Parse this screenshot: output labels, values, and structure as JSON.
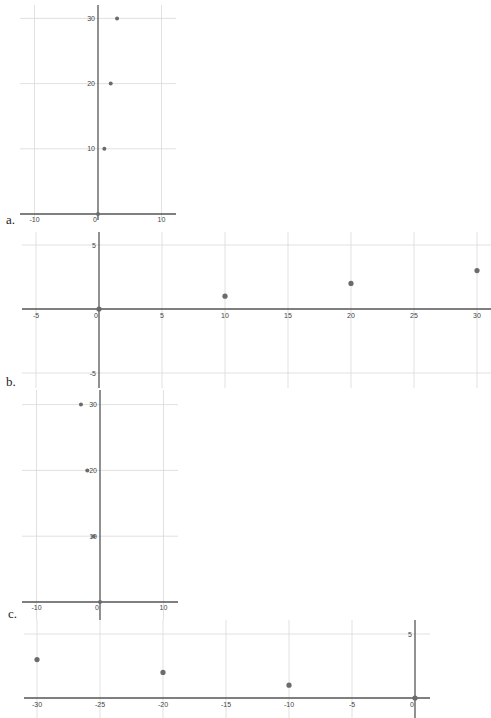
{
  "panels": {
    "a": {
      "label": "a."
    },
    "b": {
      "label": "b."
    },
    "c": {
      "label": "c."
    },
    "d": {
      "label": ""
    }
  },
  "chart_data": [
    {
      "id": "a",
      "type": "scatter",
      "title": "",
      "label": "a.",
      "xlabel": "",
      "ylabel": "",
      "x_ticks": [
        -10,
        0,
        10
      ],
      "y_ticks": [
        10,
        20,
        30
      ],
      "xlim": [
        -10,
        12
      ],
      "ylim": [
        0,
        32
      ],
      "grid": true,
      "points": [
        {
          "x": 0,
          "y": 0
        },
        {
          "x": 1,
          "y": 10
        },
        {
          "x": 2,
          "y": 20
        },
        {
          "x": 3,
          "y": 30
        }
      ]
    },
    {
      "id": "b",
      "type": "scatter",
      "title": "",
      "label": "b.",
      "xlabel": "",
      "ylabel": "",
      "x_ticks": [
        -5,
        0,
        5,
        10,
        15,
        20,
        25,
        30
      ],
      "y_ticks": [
        5,
        -5
      ],
      "xlim": [
        -6,
        31
      ],
      "ylim": [
        -6,
        6
      ],
      "grid": true,
      "points": [
        {
          "x": 0,
          "y": 0
        },
        {
          "x": 10,
          "y": 1
        },
        {
          "x": 20,
          "y": 2
        },
        {
          "x": 30,
          "y": 3
        }
      ]
    },
    {
      "id": "c",
      "type": "scatter",
      "title": "",
      "label": "c.",
      "xlabel": "",
      "ylabel": "",
      "x_ticks": [
        -10,
        0,
        10
      ],
      "y_ticks": [
        10,
        20,
        30
      ],
      "xlim": [
        -10,
        12
      ],
      "ylim": [
        0,
        32
      ],
      "grid": true,
      "points": [
        {
          "x": 0,
          "y": 0
        },
        {
          "x": -1,
          "y": 10
        },
        {
          "x": -2,
          "y": 20
        },
        {
          "x": -3,
          "y": 30
        }
      ]
    },
    {
      "id": "d",
      "type": "scatter",
      "title": "",
      "label": "",
      "xlabel": "",
      "ylabel": "",
      "x_ticks": [
        -30,
        -25,
        -20,
        -15,
        -10,
        -5,
        0
      ],
      "y_ticks": [
        5
      ],
      "xlim": [
        -31,
        1
      ],
      "ylim": [
        -1,
        6
      ],
      "grid": true,
      "points": [
        {
          "x": 0,
          "y": 0
        },
        {
          "x": -10,
          "y": 1
        },
        {
          "x": -20,
          "y": 2
        },
        {
          "x": -30,
          "y": 3
        }
      ]
    }
  ]
}
